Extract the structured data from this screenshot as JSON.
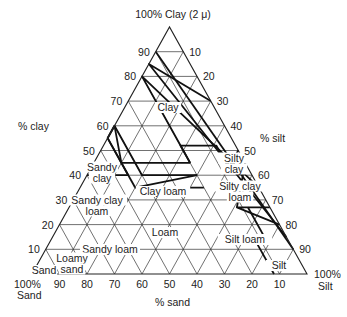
{
  "title": "100% Clay (2 μ)",
  "axes": {
    "clay_label": "% clay",
    "silt_label": "% silt",
    "sand_label": "% sand",
    "sand_corner": [
      "100%",
      "Sand"
    ],
    "silt_corner": [
      "100%",
      "Silt"
    ]
  },
  "ticks": {
    "clay": [
      "10",
      "20",
      "30",
      "40",
      "50",
      "60",
      "70",
      "80",
      "90"
    ],
    "silt": [
      "10",
      "20",
      "30",
      "40",
      "50",
      "60",
      "70",
      "80",
      "90"
    ],
    "sand": [
      "90",
      "80",
      "70",
      "60",
      "50",
      "40",
      "30",
      "20",
      "10"
    ]
  },
  "geometry": {
    "left": [
      32,
      274
    ],
    "right": [
      307,
      274
    ],
    "apex_y": 27
  },
  "classes": [
    {
      "name": "Clay",
      "lines": [
        "Clay"
      ],
      "x": 168,
      "y": 107
    },
    {
      "name": "Sandy clay",
      "lines": [
        "Sandy",
        "clay"
      ],
      "x": 102,
      "y": 172
    },
    {
      "name": "Silty clay",
      "lines": [
        "Silty",
        "clay"
      ],
      "x": 234,
      "y": 163
    },
    {
      "name": "Clay loam",
      "lines": [
        "Clay loam"
      ],
      "x": 163,
      "y": 191
    },
    {
      "name": "Silty clay loam",
      "lines": [
        "Silty clay",
        "loam"
      ],
      "x": 240,
      "y": 191
    },
    {
      "name": "Sandy clay loam",
      "lines": [
        "Sandy clay",
        "loam"
      ],
      "x": 97,
      "y": 205
    },
    {
      "name": "Loam",
      "lines": [
        "Loam"
      ],
      "x": 165,
      "y": 232
    },
    {
      "name": "Silt loam",
      "lines": [
        "Silt loam"
      ],
      "x": 245,
      "y": 239
    },
    {
      "name": "Sandy loam",
      "lines": [
        "Sandy loam"
      ],
      "x": 110,
      "y": 249
    },
    {
      "name": "Loamy sand",
      "lines": [
        "Loamy",
        "sand"
      ],
      "x": 72,
      "y": 263
    },
    {
      "name": "Sand",
      "lines": [
        "Sand"
      ],
      "x": 44,
      "y": 270
    },
    {
      "name": "Silt",
      "lines": [
        "Silt"
      ],
      "x": 279,
      "y": 265
    }
  ],
  "boundaries": [
    [
      [
        40,
        45
      ],
      [
        55,
        45
      ],
      [
        60,
        40
      ],
      [
        40,
        40
      ],
      [
        40,
        20
      ]
    ],
    [
      [
        60,
        40
      ],
      [
        55,
        45
      ]
    ],
    [
      [
        40,
        45
      ],
      [
        40,
        60
      ]
    ],
    [
      [
        55,
        45
      ],
      [
        35,
        45
      ]
    ],
    [
      [
        40,
        20
      ],
      [
        35,
        45
      ]
    ],
    [
      [
        60,
        40
      ],
      [
        45,
        45
      ],
      [
        45,
        20
      ]
    ],
    [
      [
        35,
        20
      ],
      [
        35,
        45
      ]
    ],
    [
      [
        35,
        0
      ],
      [
        80,
        20
      ],
      [
        52,
        20
      ],
      [
        45,
        20
      ]
    ],
    [
      [
        45,
        20
      ],
      [
        52,
        20
      ],
      [
        52,
        7
      ],
      [
        43,
        7
      ],
      [
        50,
        0
      ]
    ],
    [
      [
        15,
        0
      ],
      [
        85,
        15
      ],
      [
        70,
        0
      ]
    ],
    [
      [
        10,
        0
      ],
      [
        90,
        10
      ]
    ],
    [
      [
        27,
        0
      ],
      [
        27,
        12
      ],
      [
        20,
        0
      ]
    ],
    [
      [
        0,
        12
      ],
      [
        12,
        12
      ]
    ],
    [
      [
        27,
        8
      ],
      [
        12,
        8
      ]
    ],
    [
      [
        27,
        12
      ],
      [
        45,
        0
      ]
    ]
  ]
}
